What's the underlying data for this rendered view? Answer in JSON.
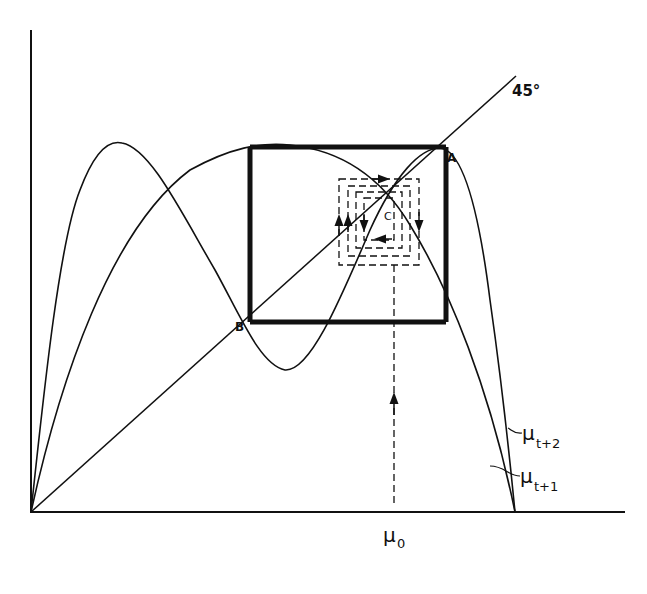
{
  "diagram": {
    "type": "cobweb phase diagram",
    "axes": {
      "x_axis": "horizontal",
      "y_axis": "vertical"
    },
    "labels": {
      "diagonal": "45°",
      "point_a": "A",
      "point_b": "B",
      "point_c": "C",
      "curve_first_iterate": "μt+1",
      "curve_second_iterate": "μt+2",
      "initial_value": "μ0"
    },
    "label_parts": {
      "mu": "μ",
      "sub_t1": "t+1",
      "sub_t2": "t+2",
      "sub_0": "0"
    },
    "colors": {
      "ink": "#111111",
      "background": "#ffffff"
    }
  }
}
